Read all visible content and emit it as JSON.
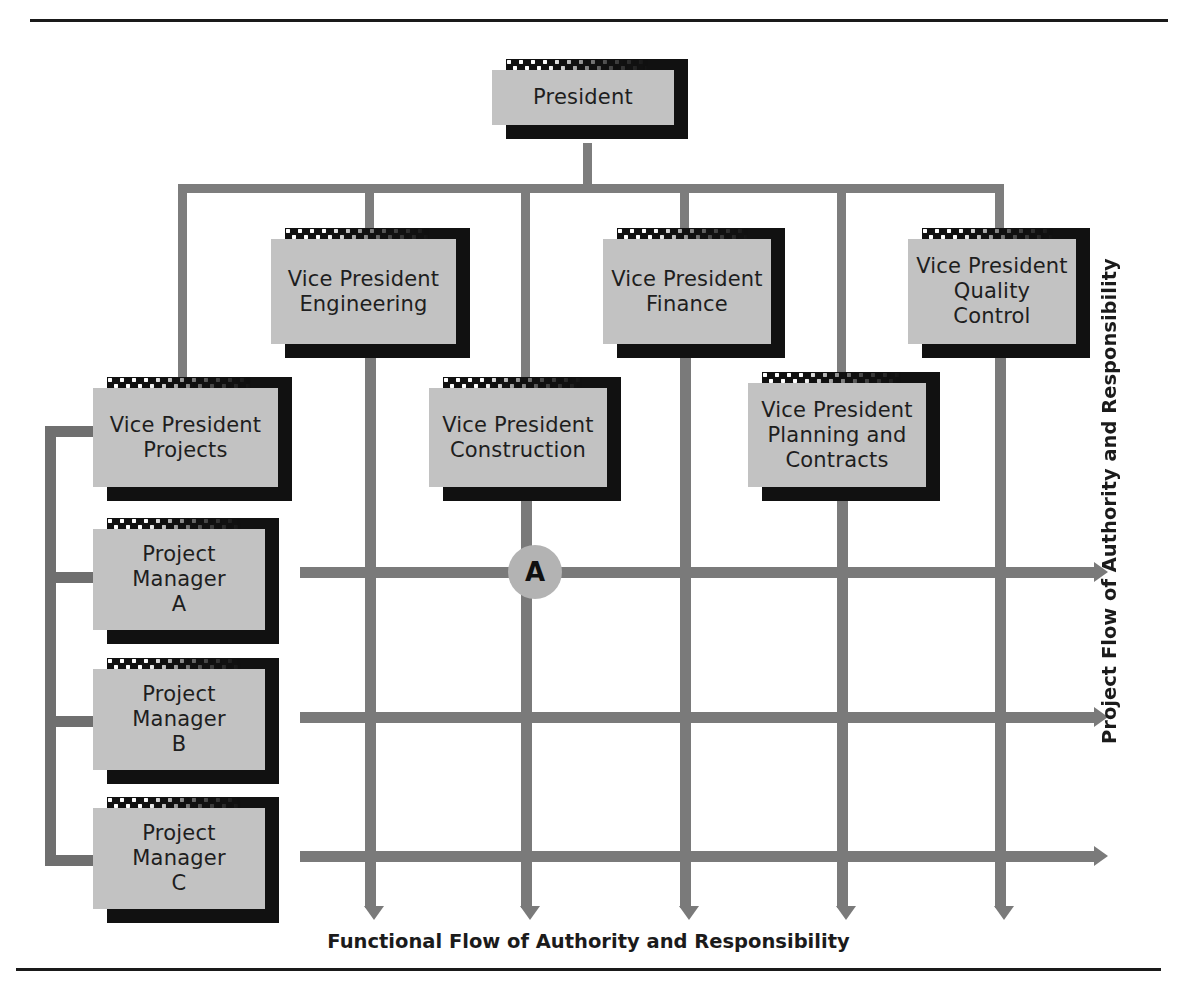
{
  "diagram": {
    "title_top_rule": "",
    "nodes": {
      "president": {
        "label": "President"
      },
      "vp_engineering": {
        "label": "Vice President\nEngineering"
      },
      "vp_finance": {
        "label": "Vice President\nFinance"
      },
      "vp_quality": {
        "label": "Vice President\nQuality\nControl"
      },
      "vp_projects": {
        "label": "Vice President\nProjects"
      },
      "vp_construction": {
        "label": "Vice President\nConstruction"
      },
      "vp_planning": {
        "label": "Vice President\nPlanning and\nContracts"
      },
      "pm_a": {
        "label": "Project\nManager\nA"
      },
      "pm_b": {
        "label": "Project\nManager\nB"
      },
      "pm_c": {
        "label": "Project\nManager\nC"
      }
    },
    "junction_marker": {
      "label": "A"
    },
    "captions": {
      "functional_axis": "Functional Flow of Authority and Responsibility",
      "project_axis": "Project Flow of Authority and Responsibility"
    },
    "colors": {
      "card_face": "#c2c2c2",
      "card_shadow": "#111111",
      "connector": "#7d7d7d",
      "matrix_line": "#7a7a7a",
      "junction_fill": "#b3b3b3",
      "rule": "#1a1a1a",
      "text": "#1e1e1e"
    }
  }
}
